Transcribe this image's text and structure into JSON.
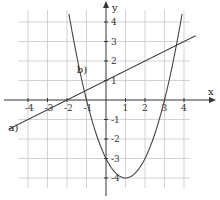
{
  "chart_data": {
    "type": "line",
    "title": "",
    "xlabel": "x",
    "ylabel": "y",
    "xlim": [
      -5.2,
      5
    ],
    "ylim": [
      -4.4,
      5.1
    ],
    "grid": true,
    "x_ticks": [
      -4,
      -3,
      -2,
      -1,
      1,
      2,
      3,
      4
    ],
    "y_ticks": [
      -4,
      -3,
      -2,
      -1,
      1,
      2,
      3,
      4
    ],
    "x_tick_labels": [
      "-4",
      "-3",
      "-2",
      "-1",
      "1",
      "2",
      "3",
      "4"
    ],
    "y_tick_labels": [
      "-4",
      "-3",
      "-2",
      "-1",
      "1",
      "2",
      "3",
      "4"
    ],
    "series": [
      {
        "name": "a)",
        "kind": "line",
        "equation": "y = 0.5x + 1",
        "x": [
          -5,
          -4,
          -2,
          0,
          2,
          4,
          4.6
        ],
        "y": [
          -1.5,
          -1,
          0,
          1,
          2,
          3,
          3.3
        ]
      },
      {
        "name": "b)",
        "kind": "parabola",
        "equation": "y = x^2 - 2x - 3",
        "x": [
          -1.9,
          -1,
          0,
          1,
          2,
          3,
          3.9
        ],
        "y": [
          4.41,
          0,
          -3,
          -4,
          -3,
          0,
          4.41
        ]
      }
    ],
    "annotations": [
      {
        "text": "a)",
        "x": -5.0,
        "y": -1.6
      },
      {
        "text": "b)",
        "x": -1.5,
        "y": 1.4
      }
    ]
  },
  "colors": {
    "grid": "#c8c8c8",
    "axis": "#333333",
    "curve": "#444444",
    "background": "#ffffff"
  }
}
